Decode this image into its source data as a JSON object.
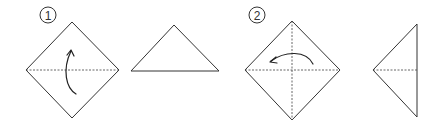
{
  "diagram": {
    "steps": [
      {
        "number": "1",
        "instruction": "Fold bottom corner up to top along horizontal crease",
        "result_shape": "triangle"
      },
      {
        "number": "2",
        "instruction": "Fold right corner over to left along vertical crease",
        "result_shape": "triangle"
      }
    ],
    "colors": {
      "line": "#333333",
      "background": "#ffffff"
    }
  }
}
